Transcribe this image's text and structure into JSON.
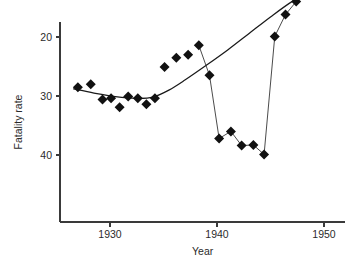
{
  "chart_data": {
    "type": "scatter",
    "title": "",
    "xlabel": "Year",
    "ylabel": "Fatality rate",
    "xlim": [
      1926,
      1952
    ],
    "ylim": [
      8.5,
      42
    ],
    "grid": false,
    "legend": "none",
    "xticks": [
      1930,
      1940,
      1950
    ],
    "xtick_labels": [
      "1930",
      "1940",
      "1950"
    ],
    "yticks": [
      10,
      20,
      30,
      40
    ],
    "ytick_labels": [
      "10",
      "20",
      "30",
      "40"
    ],
    "series": [
      {
        "name": "Fatality rate observations",
        "marker": "filled-diamond",
        "color": "#111111",
        "x": [
          1927,
          1928.2,
          1929.3,
          1930.1,
          1930.9,
          1931.7,
          1932.6,
          1933.4,
          1934.2,
          1935.1,
          1936.2,
          1937.3,
          1938.3,
          1939.3,
          1940.2,
          1941.3,
          1942.3,
          1943.4,
          1944.4,
          1945.4,
          1946.4,
          1947.4,
          1948.4,
          1949.2,
          1950.2,
          1951.2
        ],
        "y": [
          28.5,
          28.0,
          30.6,
          30.4,
          31.9,
          30.1,
          30.4,
          31.4,
          30.4,
          25.1,
          23.5,
          23.0,
          21.4,
          26.5,
          37.2,
          36.0,
          38.4,
          38.3,
          39.9,
          19.9,
          16.2,
          14.0,
          11.9,
          11.5,
          11.2,
          11.0
        ]
      }
    ],
    "connector_line": {
      "name": "observed-series-connector",
      "x": [
        1938.3,
        1939.3,
        1940.2,
        1941.3,
        1942.3,
        1943.4,
        1944.4,
        1945.4,
        1946.4,
        1947.4
      ],
      "y": [
        21.4,
        26.5,
        37.2,
        36.0,
        38.4,
        38.3,
        39.9,
        19.9,
        16.2,
        14.0
      ]
    },
    "trend_curve": {
      "name": "fitted-trend",
      "x": [
        1926.6,
        1928.5,
        1930.5,
        1932.5,
        1934.0,
        1935.5,
        1937.0,
        1939.0,
        1941.0,
        1943.0,
        1945.0,
        1947.0,
        1948.5,
        1950.0,
        1951.6
      ],
      "y": [
        28.8,
        29.5,
        30.1,
        30.4,
        30.2,
        29.0,
        27.3,
        24.8,
        22.2,
        19.4,
        16.6,
        14.0,
        12.6,
        11.4,
        10.7
      ]
    }
  },
  "axes": {
    "y_label": "Fatality rate",
    "x_label": "Year"
  }
}
